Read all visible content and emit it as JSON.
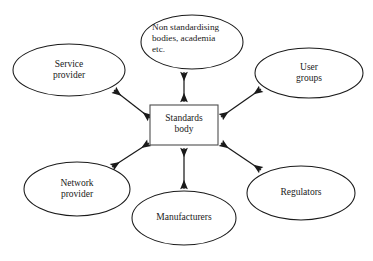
{
  "diagram": {
    "type": "hub-and-spoke relationship diagram",
    "background_color": "#ffffff",
    "stroke_color": "#1a1a1a",
    "center": {
      "id": "standards-body",
      "shape": "rectangle",
      "label": "Standards\nbody",
      "label_line1": "Standards",
      "label_line2": "body",
      "x": 150,
      "y": 105,
      "width": 68,
      "height": 40
    },
    "nodes": [
      {
        "id": "non-standardising-bodies",
        "shape": "ellipse",
        "label_line1": "Non standardising",
        "label_line2": "bodies, academia",
        "label_line3": "etc.",
        "cx": 192,
        "cy": 42,
        "rx": 51,
        "ry": 27,
        "position": "top"
      },
      {
        "id": "service-provider",
        "shape": "ellipse",
        "label_line1": "Service",
        "label_line2": "provider",
        "cx": 69,
        "cy": 70,
        "rx": 56,
        "ry": 26,
        "position": "top-left"
      },
      {
        "id": "user-groups",
        "shape": "ellipse",
        "label_line1": "User",
        "label_line2": "groups",
        "cx": 309,
        "cy": 73,
        "rx": 54,
        "ry": 25,
        "position": "top-right"
      },
      {
        "id": "network-provider",
        "shape": "ellipse",
        "label_line1": "Network",
        "label_line2": "provider",
        "cx": 77,
        "cy": 189,
        "rx": 53,
        "ry": 27,
        "position": "bottom-left"
      },
      {
        "id": "manufacturers",
        "shape": "ellipse",
        "label_line1": "Manufacturers",
        "label_line2": "",
        "cx": 184,
        "cy": 218,
        "rx": 52,
        "ry": 27,
        "position": "bottom"
      },
      {
        "id": "regulators",
        "shape": "ellipse",
        "label_line1": "Regulators",
        "label_line2": "",
        "cx": 301,
        "cy": 193,
        "rx": 54,
        "ry": 27,
        "position": "bottom-right"
      }
    ],
    "connections": [
      {
        "from": "standards-body",
        "to": "non-standardising-bodies",
        "style": "double-headed-arrow"
      },
      {
        "from": "standards-body",
        "to": "service-provider",
        "style": "double-headed-arrow"
      },
      {
        "from": "standards-body",
        "to": "user-groups",
        "style": "double-headed-arrow"
      },
      {
        "from": "standards-body",
        "to": "network-provider",
        "style": "double-headed-arrow"
      },
      {
        "from": "standards-body",
        "to": "manufacturers",
        "style": "double-headed-arrow"
      },
      {
        "from": "standards-body",
        "to": "regulators",
        "style": "double-headed-arrow"
      }
    ]
  }
}
